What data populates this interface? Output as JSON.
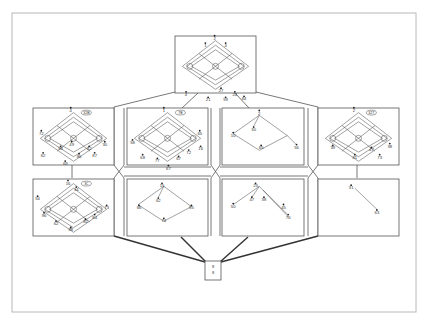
{
  "figure": {
    "frame_color": "#b0b0b0",
    "line_color": "#444444",
    "box_color": "#555555",
    "panels": [
      {
        "id": "top",
        "label_circled": [
          "①8",
          "②3"
        ],
        "nodes": [
          {
            "label": "2",
            "x": 43,
            "y": 3
          },
          {
            "label": "1",
            "x": 33,
            "y": 11
          },
          {
            "label": "4",
            "x": 55,
            "y": 11
          },
          {
            "label": "27",
            "x": 50,
            "y": 60
          },
          {
            "label": "24",
            "x": 65,
            "y": 64
          },
          {
            "label": "64",
            "x": 75,
            "y": 69
          },
          {
            "label": "4",
            "x": 12,
            "y": 64
          },
          {
            "label": "21",
            "x": 36,
            "y": 70
          },
          {
            "label": "59",
            "x": 55,
            "y": 70
          }
        ]
      },
      {
        "id": "mid-1",
        "tag": "32B",
        "nodes": [
          {
            "label": "4",
            "x": 41,
            "y": 3
          },
          {
            "label": "72",
            "x": 9,
            "y": 28
          },
          {
            "label": "53",
            "x": 30,
            "y": 45
          },
          {
            "label": "62",
            "x": 11,
            "y": 52
          },
          {
            "label": "49",
            "x": 42,
            "y": 40
          },
          {
            "label": "86",
            "x": 50,
            "y": 53
          },
          {
            "label": "42",
            "x": 61,
            "y": 45
          },
          {
            "label": "87",
            "x": 67,
            "y": 52
          },
          {
            "label": "30",
            "x": 78,
            "y": 40
          },
          {
            "label": "69",
            "x": 35,
            "y": 61
          }
        ]
      },
      {
        "id": "mid-2",
        "tag": "7B",
        "nodes": [
          {
            "label": "1",
            "x": 40,
            "y": 3
          },
          {
            "label": "58",
            "x": 6,
            "y": 38
          },
          {
            "label": "68",
            "x": 17,
            "y": 54
          },
          {
            "label": "77",
            "x": 33,
            "y": 58
          },
          {
            "label": "67",
            "x": 45,
            "y": 66
          },
          {
            "label": "67",
            "x": 56,
            "y": 56
          },
          {
            "label": "72",
            "x": 67,
            "y": 49
          },
          {
            "label": "65",
            "x": 79,
            "y": 28
          },
          {
            "label": "16",
            "x": 80,
            "y": 45
          }
        ]
      },
      {
        "id": "mid-3",
        "nodes": [
          {
            "label": "2",
            "x": 40,
            "y": 6
          },
          {
            "label": "30",
            "x": 34,
            "y": 24
          },
          {
            "label": "10",
            "x": 12,
            "y": 30
          },
          {
            "label": "65",
            "x": 42,
            "y": 44
          },
          {
            "label": "56",
            "x": 80,
            "y": 43
          }
        ]
      },
      {
        "id": "mid-4",
        "tag": "32T",
        "nodes": [
          {
            "label": "2",
            "x": 39,
            "y": 3
          },
          {
            "label": "39",
            "x": 16,
            "y": 44
          },
          {
            "label": "81",
            "x": 40,
            "y": 54
          },
          {
            "label": "47",
            "x": 58,
            "y": 46
          },
          {
            "label": "73",
            "x": 67,
            "y": 54
          },
          {
            "label": "38",
            "x": 78,
            "y": 42
          }
        ]
      },
      {
        "id": "bot-1",
        "tag": "3C",
        "nodes": [
          {
            "label": "16",
            "x": 38,
            "y": 5
          },
          {
            "label": "34",
            "x": 47,
            "y": 12
          },
          {
            "label": "54",
            "x": 5,
            "y": 22
          },
          {
            "label": "96",
            "x": 12,
            "y": 40
          },
          {
            "label": "62",
            "x": 25,
            "y": 49
          },
          {
            "label": "88",
            "x": 41,
            "y": 56
          },
          {
            "label": "82",
            "x": 57,
            "y": 47
          },
          {
            "label": "84",
            "x": 67,
            "y": 42
          },
          {
            "label": "73",
            "x": 80,
            "y": 32
          }
        ]
      },
      {
        "id": "bot-2",
        "nodes": [
          {
            "label": "15",
            "x": 38,
            "y": 8
          },
          {
            "label": "62",
            "x": 34,
            "y": 24
          },
          {
            "label": "66",
            "x": 13,
            "y": 32
          },
          {
            "label": "55",
            "x": 70,
            "y": 32
          },
          {
            "label": "74",
            "x": 40,
            "y": 46
          }
        ]
      },
      {
        "id": "bot-3",
        "nodes": [
          {
            "label": "23",
            "x": 36,
            "y": 8
          },
          {
            "label": "47",
            "x": 32,
            "y": 23
          },
          {
            "label": "38",
            "x": 45,
            "y": 23
          },
          {
            "label": "50",
            "x": 12,
            "y": 30
          },
          {
            "label": "45",
            "x": 66,
            "y": 31
          },
          {
            "label": "70",
            "x": 71,
            "y": 42
          }
        ]
      },
      {
        "id": "bot-4",
        "nodes": [
          {
            "label": "31",
            "x": 36,
            "y": 10
          },
          {
            "label": "63",
            "x": 64,
            "y": 37
          }
        ]
      }
    ],
    "root_box_labels": [
      "8",
      "8"
    ]
  }
}
